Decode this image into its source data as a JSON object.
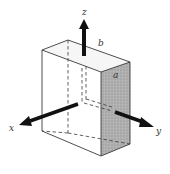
{
  "figure": {
    "type": "3d-rectangular-block-with-axes",
    "axes": [
      {
        "name": "x",
        "label": "x"
      },
      {
        "name": "y",
        "label": "y"
      },
      {
        "name": "z",
        "label": "z"
      }
    ],
    "dimension_labels": [
      {
        "name": "b",
        "label": "b"
      },
      {
        "name": "a",
        "label": "a"
      }
    ],
    "colors": {
      "line": "#3a3a3a",
      "arrow": "#111111",
      "shaded_face": "#a8a8a8",
      "top_face": "#f4f4f4",
      "background": "#ffffff"
    }
  }
}
